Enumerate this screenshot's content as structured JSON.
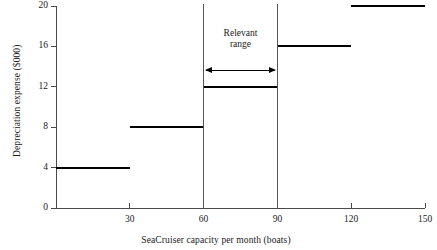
{
  "chart_data": {
    "type": "bar",
    "title": "",
    "subtitle": "",
    "xlabel": "SeaCruiser capacity per month (boats)",
    "ylabel": "Depreciation expense ($000)",
    "xlim": [
      0,
      150
    ],
    "ylim": [
      0,
      20
    ],
    "grid": false,
    "legend": null,
    "x_ticks": [
      {
        "value": 30,
        "label": "30"
      },
      {
        "value": 60,
        "label": "60"
      },
      {
        "value": 90,
        "label": "90"
      },
      {
        "value": 120,
        "label": "120"
      },
      {
        "value": 150,
        "label": "150"
      }
    ],
    "y_ticks": [
      {
        "value": 0,
        "label": "0"
      },
      {
        "value": 4,
        "label": "4"
      },
      {
        "value": 8,
        "label": "8"
      },
      {
        "value": 12,
        "label": "12"
      },
      {
        "value": 16,
        "label": "16"
      },
      {
        "value": 20,
        "label": "20"
      }
    ],
    "categories": [
      "0-30",
      "30-60",
      "60-90",
      "90-120",
      "120-150"
    ],
    "values": [
      4,
      8,
      12,
      16,
      20
    ],
    "steps": [
      {
        "x_start": 0,
        "x_end": 30,
        "y": 4
      },
      {
        "x_start": 30,
        "x_end": 60,
        "y": 8
      },
      {
        "x_start": 60,
        "x_end": 90,
        "y": 12
      },
      {
        "x_start": 90,
        "x_end": 120,
        "y": 16
      },
      {
        "x_start": 120,
        "x_end": 150,
        "y": 20
      }
    ],
    "annotations": [
      {
        "name": "relevant-range",
        "text": "Relevant\nrange",
        "x_start": 60,
        "x_end": 90
      }
    ],
    "series_color": "#000000",
    "axis_color": "#4a4a4a"
  }
}
